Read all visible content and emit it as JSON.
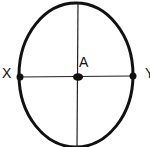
{
  "diagram": {
    "shape": "ellipse",
    "colors": {
      "stroke": "#111111",
      "background": "#ffffff"
    },
    "ellipse": {
      "cx": 76,
      "cy": 75,
      "rx": 57,
      "ry": 72
    },
    "axes": {
      "horizontal": {
        "x1": 19,
        "y1": 77,
        "x2": 133,
        "y2": 76
      },
      "vertical": {
        "x1": 78,
        "y1": 3,
        "x2": 77,
        "y2": 147
      }
    },
    "points": [
      {
        "id": "X",
        "label": "X",
        "x": 20,
        "y": 77
      },
      {
        "id": "A",
        "label": "A",
        "x": 78,
        "y": 77
      },
      {
        "id": "Y",
        "label": "Y",
        "x": 133,
        "y": 76
      }
    ]
  }
}
